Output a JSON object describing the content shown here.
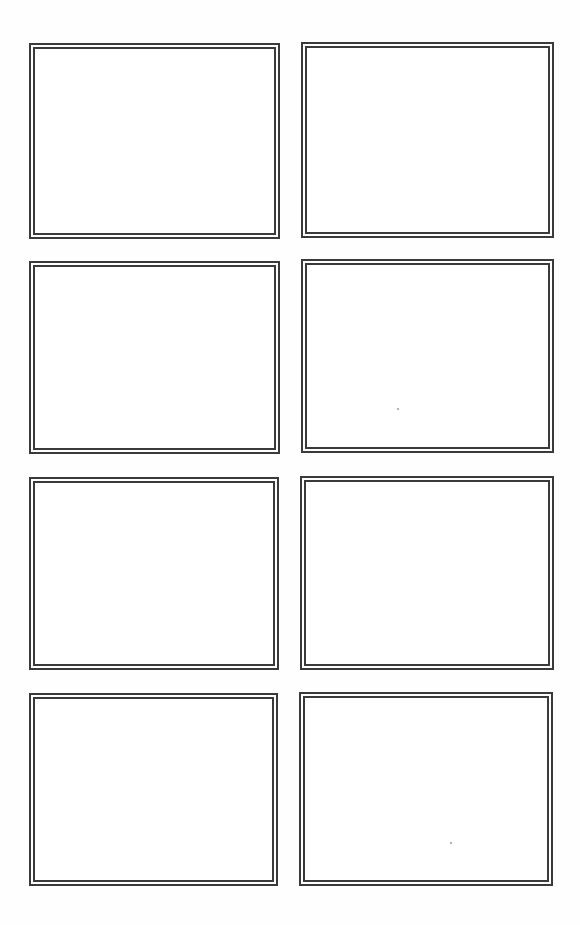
{
  "page": {
    "type": "storyboard-template",
    "background": "#ffffff",
    "border_color": "#3a3a3a",
    "columns": 2,
    "rows": 4
  },
  "panels": [
    {
      "id": 1,
      "label": "",
      "x": 29,
      "y": 43,
      "w": 251,
      "h": 196
    },
    {
      "id": 2,
      "label": "",
      "x": 301,
      "y": 42,
      "w": 253,
      "h": 196
    },
    {
      "id": 3,
      "label": "",
      "x": 29,
      "y": 261,
      "w": 251,
      "h": 193
    },
    {
      "id": 4,
      "label": "",
      "x": 301,
      "y": 259,
      "w": 253,
      "h": 194
    },
    {
      "id": 5,
      "label": "",
      "x": 29,
      "y": 477,
      "w": 250,
      "h": 193
    },
    {
      "id": 6,
      "label": "",
      "x": 300,
      "y": 476,
      "w": 254,
      "h": 194
    },
    {
      "id": 7,
      "label": "",
      "x": 29,
      "y": 693,
      "w": 249,
      "h": 193
    },
    {
      "id": 8,
      "label": "",
      "x": 299,
      "y": 692,
      "w": 254,
      "h": 194
    }
  ]
}
